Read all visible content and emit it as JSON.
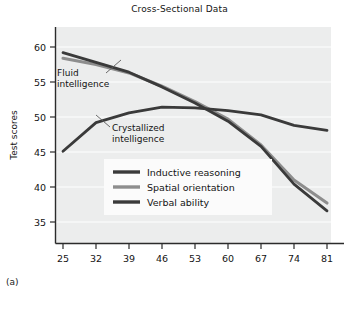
{
  "figure": {
    "panel_label": "(a)",
    "title": "Cross-Sectional Data"
  },
  "annotations": [
    {
      "id": "fluid",
      "line1": "Fluid",
      "line2": "intelligence"
    },
    {
      "id": "crystallized",
      "line1": "Crystallized",
      "line2": "intelligence"
    }
  ],
  "colors": {
    "plot_background": "#eceded",
    "gridline": "#f7f8f8",
    "axis": "#2b2b2b",
    "series_dark": "#3a3a3a",
    "series_gray": "#8d8d8d",
    "legend_background": "#fbfbfb",
    "text": "#141414"
  },
  "chart_data": {
    "type": "line",
    "title": "Cross-Sectional Data",
    "xlabel": "Age (years)",
    "ylabel": "Test scores",
    "x": [
      25,
      32,
      39,
      46,
      53,
      60,
      67,
      74,
      81
    ],
    "categories": [
      "25",
      "32",
      "39",
      "46",
      "53",
      "60",
      "67",
      "74",
      "81"
    ],
    "xlim": [
      25,
      81
    ],
    "ylim": [
      33.2,
      61.8
    ],
    "yticks": [
      35,
      40,
      45,
      50,
      55,
      60
    ],
    "xticks": [
      25,
      32,
      39,
      46,
      53,
      60,
      67,
      74,
      81
    ],
    "grid": true,
    "legend_position": "center",
    "series": [
      {
        "name": "Inductive reasoning",
        "color": "#3a3a3a",
        "values": [
          59.2,
          57.8,
          56.4,
          54.3,
          52.0,
          49.4,
          45.8,
          40.4,
          36.6
        ]
      },
      {
        "name": "Spatial orientation",
        "color": "#8d8d8d",
        "values": [
          58.4,
          57.5,
          56.3,
          54.4,
          52.2,
          49.7,
          46.0,
          41.0,
          37.7
        ]
      },
      {
        "name": "Verbal ability",
        "color": "#3a3a3a",
        "values": [
          45.1,
          49.2,
          50.6,
          51.4,
          51.3,
          50.9,
          50.3,
          48.8,
          48.1
        ]
      }
    ],
    "annotation_labels": [
      "Fluid intelligence",
      "Crystallized intelligence"
    ]
  }
}
